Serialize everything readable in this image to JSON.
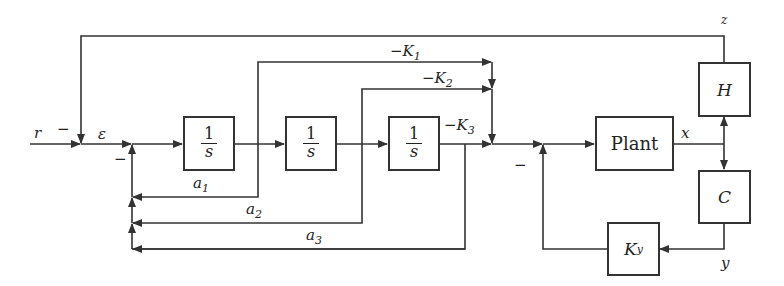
{
  "diagram": {
    "type": "block-diagram",
    "signals": {
      "reference": "r",
      "error": "ε",
      "state": "x",
      "output_z": "z",
      "output_y": "y"
    },
    "signs": {
      "sum1_minus": "−",
      "sum2_minus": "−",
      "sum4_minus": "−"
    },
    "blocks": {
      "integrator1": {
        "num": "1",
        "den": "s"
      },
      "integrator2": {
        "num": "1",
        "den": "s"
      },
      "integrator3": {
        "num": "1",
        "den": "s"
      },
      "plant": "Plant",
      "H": "H",
      "C": "C",
      "Ky": {
        "main": "K",
        "sub": "y"
      }
    },
    "gains": {
      "K1": {
        "main": "−K",
        "sub": "1"
      },
      "K2": {
        "main": "−K",
        "sub": "2"
      },
      "K3": {
        "main": "−K",
        "sub": "3"
      },
      "a1": {
        "main": "a",
        "sub": "1"
      },
      "a2": {
        "main": "a",
        "sub": "2"
      },
      "a3": {
        "main": "a",
        "sub": "3"
      }
    }
  }
}
